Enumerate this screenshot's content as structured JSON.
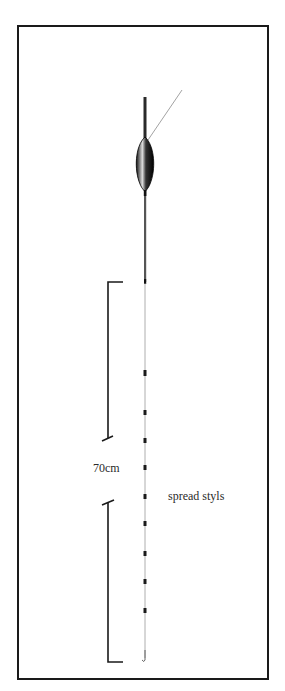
{
  "figure": {
    "type": "float rig diagram",
    "labels": {
      "length": "70cm",
      "shot_pattern": "spread styls"
    },
    "colors": {
      "ink": "#1a1a1a",
      "line": "#7a7a7a",
      "background": "#ffffff"
    },
    "float": {
      "antenna_top_y": 97,
      "body_top_y": 138,
      "body_bottom_y": 190,
      "stem_bottom_y": 283
    },
    "shots_y": [
      373,
      413,
      441,
      468,
      497,
      524,
      554,
      582,
      611
    ],
    "hook_y": 658,
    "bracket": {
      "upper": {
        "top_y": 282,
        "bottom_y": 438
      },
      "lower": {
        "top_y": 502,
        "bottom_y": 662
      }
    }
  }
}
